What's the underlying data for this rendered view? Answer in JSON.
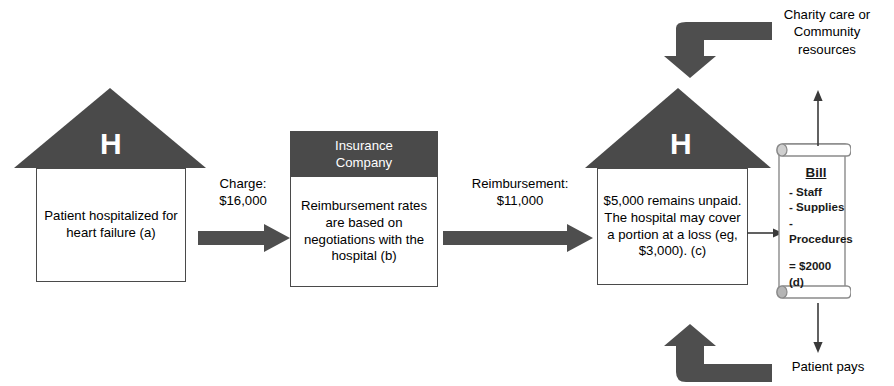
{
  "diagram": {
    "colors": {
      "dark_gray": "#4a4a4a",
      "arrow_gray": "#555555",
      "white": "#ffffff",
      "border_gray": "#4a4a4a"
    }
  },
  "hospital_1": {
    "roof_letter": "H",
    "body_text": "Patient hospitalized for heart failure (a)"
  },
  "arrow_charge": {
    "label_line_1": "Charge:",
    "label_line_2": "$16,000"
  },
  "insurance": {
    "header_line_1": "Insurance",
    "header_line_2": "Company",
    "body_text": "Reimbursement rates are based on negotiations with the hospital (b)"
  },
  "arrow_reimbursement": {
    "label_line_1": "Reimbursement:",
    "label_line_2": "$11,000"
  },
  "hospital_2": {
    "roof_letter": "H",
    "body_text": "$5,000 remains unpaid. The hospital may cover a portion at a loss (eg,  $3,000). (c)"
  },
  "bill": {
    "title": "Bill",
    "items": [
      "- Staff",
      "- Supplies",
      "- Procedures"
    ],
    "total": "= $2000 (d)"
  },
  "charity": {
    "line_1": "Charity care or",
    "line_2": "Community",
    "line_3": "resources"
  },
  "patient_pays": {
    "label": "Patient pays"
  }
}
